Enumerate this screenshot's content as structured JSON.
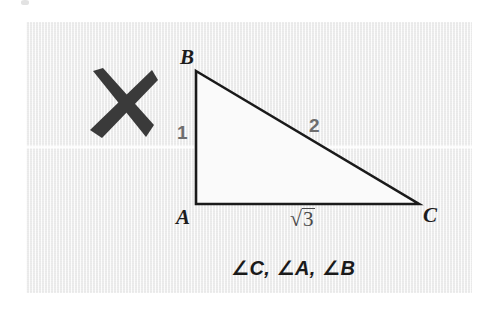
{
  "figure": {
    "type": "geometry-diagram",
    "background_color": "#f2f2f2",
    "page_color": "#ffffff",
    "stroke_color": "#1a1a1a",
    "mark_color": "#3a3a3a",
    "side_label_color": "#6e6e6e"
  },
  "grading_mark": {
    "name": "x-mark",
    "symbol": "✕",
    "meaning": "incorrect",
    "color": "#3a3a3a"
  },
  "triangle": {
    "vertices": [
      {
        "name": "A",
        "label": "A",
        "x": 196,
        "y": 204
      },
      {
        "name": "B",
        "label": "B",
        "x": 196,
        "y": 71
      },
      {
        "name": "C",
        "label": "C",
        "x": 419,
        "y": 204
      }
    ],
    "right_angle_at": "A",
    "sides": [
      {
        "name": "AB",
        "label": "1",
        "from": "A",
        "to": "B"
      },
      {
        "name": "BC",
        "label": "2",
        "from": "B",
        "to": "C"
      },
      {
        "name": "AC",
        "label": "√3",
        "radicand": "3",
        "from": "A",
        "to": "C"
      }
    ]
  },
  "labels": {
    "vertex_a": "A",
    "vertex_b": "B",
    "vertex_c": "C",
    "side_leg_vertical": "1",
    "side_hypotenuse": "2",
    "side_leg_horizontal_radicand": "3",
    "radical_sign": "√"
  },
  "answer": {
    "text": "∠C, ∠A, ∠B",
    "items": [
      "∠C",
      "∠A",
      "∠B"
    ],
    "ordering": "ascending-by-angle-measure"
  }
}
